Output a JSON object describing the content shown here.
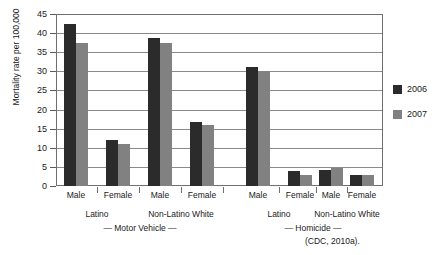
{
  "chart_data": {
    "type": "bar",
    "title": "",
    "xlabel": "",
    "ylabel": "Mortality rate per 100,000",
    "ylim": [
      0,
      45
    ],
    "yticks": [
      0,
      5,
      10,
      15,
      20,
      25,
      30,
      35,
      40,
      45
    ],
    "grid": true,
    "legend_position": "right",
    "categories": [
      "Male",
      "Female",
      "Male",
      "Female",
      "Male",
      "Female",
      "Male",
      "Female"
    ],
    "groups": [
      {
        "label": "Latino",
        "section": "Motor Vehicle"
      },
      {
        "label": "Non-Latino White",
        "section": "Motor Vehicle"
      },
      {
        "label": "Latino",
        "section": "Homicide"
      },
      {
        "label": "Non-Latino White",
        "section": "Homicide"
      }
    ],
    "sections": [
      "— Motor Vehicle —",
      "— Homicide —"
    ],
    "series": [
      {
        "name": "2006",
        "color": "#2b2b2b",
        "values": [
          42.5,
          12.0,
          38.7,
          16.8,
          31.2,
          4.0,
          4.2,
          3.0
        ]
      },
      {
        "name": "2007",
        "color": "#818181",
        "values": [
          37.4,
          11.0,
          37.4,
          16.0,
          30.0,
          3.0,
          4.8,
          3.0
        ]
      }
    ],
    "source": "(CDC, 2010a)."
  },
  "axis": {
    "y_title": "Mortality rate per 100,000",
    "tick_labels": [
      "45",
      "40",
      "35",
      "30",
      "25",
      "20",
      "15",
      "10",
      "5",
      "0"
    ]
  },
  "xaxis": {
    "bar_labels": [
      "Male",
      "Female",
      "Male",
      "Female",
      "Male",
      "Female",
      "Male",
      "Female"
    ],
    "group_labels": [
      "Latino",
      "Non-Latino White",
      "Latino",
      "Non-Latino White"
    ],
    "section_labels": [
      "— Motor Vehicle —",
      "— Homicide —"
    ]
  },
  "legend": {
    "items": [
      {
        "label": "2006",
        "color": "#2b2b2b"
      },
      {
        "label": "2007",
        "color": "#818181"
      }
    ]
  },
  "footer": {
    "source": "(CDC, 2010a)."
  }
}
